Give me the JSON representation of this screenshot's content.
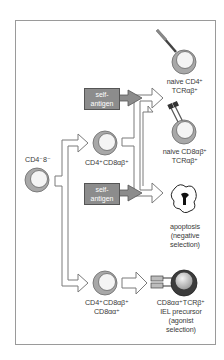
{
  "figure": {
    "nodes": {
      "dn": {
        "label": "CD4⁻8⁻"
      },
      "dp": {
        "label": "CD4⁺CD8αβ⁺"
      },
      "tp": {
        "line1": "CD4⁺CD8αβ⁺",
        "line2": "CD8αα⁺"
      },
      "naive_cd4": {
        "line1": "naive CD4⁺",
        "line2": "TCRαβ⁺"
      },
      "naive_cd8": {
        "line1": "naive CD8αβ⁺",
        "line2": "TCRαβ⁺"
      },
      "apoptosis": {
        "line1": "apoptosis",
        "line2": "(negative",
        "line3": "selection)"
      },
      "iel": {
        "line1": "CD8αα⁺TCRβ⁺",
        "line2": "IEL precursor",
        "line3": "(agonist",
        "line4": "selection)"
      }
    },
    "self_antigen_boxes": [
      {
        "line1": "self-",
        "line2": "antigen"
      },
      {
        "line1": "self-",
        "line2": "antigen"
      }
    ],
    "colors": {
      "cell_outer": "#a8a8a8",
      "cell_inner": "#f4f4f4",
      "antigen_box": "#8c8c8c",
      "arrow_outline": "#7a7a7a",
      "iel_outer": "#3c3c3c",
      "iel_inner": "#c8c8c8",
      "frame": "#9a9a9a"
    }
  }
}
